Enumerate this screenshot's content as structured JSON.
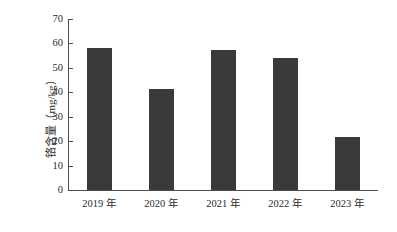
{
  "chart_data": {
    "type": "bar",
    "title": "",
    "xlabel": "",
    "ylabel": "铬含量（mg/kg）",
    "categories": [
      "2019 年",
      "2020 年",
      "2021 年",
      "2022 年",
      "2023 年"
    ],
    "values": [
      58.0,
      41.5,
      57.5,
      54.0,
      21.5
    ],
    "series": [
      {
        "name": "铬含量",
        "values": [
          58.0,
          41.5,
          57.5,
          54.0,
          21.5
        ]
      }
    ],
    "ylim": [
      0,
      70
    ],
    "yticks": [
      0,
      10,
      20,
      30,
      40,
      50,
      60,
      70
    ],
    "ytick_labels": [
      "0",
      "10",
      "20",
      "30",
      "40",
      "50",
      "60",
      "70"
    ],
    "grid": false,
    "legend": false,
    "legend_position": "none",
    "bar_color": "#3a3a3a",
    "axis_color": "#4d4d4d",
    "background_color": "#ffffff"
  }
}
